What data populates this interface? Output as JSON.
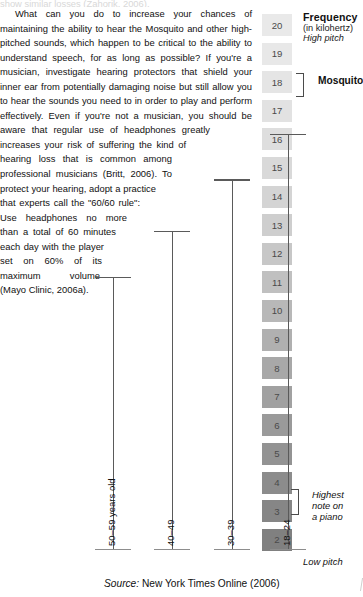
{
  "article": {
    "cut_line": "show similar losses (Zahorik, 2006).",
    "paragraph": "What can you do to increase your chances of maintaining the ability to hear the Mosquito and other high-pitched sounds, which happen to be critical to the ability to understand speech, for as long as possible? If you're a musician, investigate hearing protectors that shield your inner ear from potentially damaging noise but still allow you to hear the sounds you need to in order to play and perform effectively. Even if you're not a musician, you should be aware that regular use of headphones greatly increases your risk of suffering the kind of hearing loss that is common among professional musicians (Britt, 2006). To protect your hearing, adopt a practice that experts call the \"60/60 rule\": Use headphones no more than a total of 60 minutes each day with the player set on 60% of its maximum volume (Mayo Clinic, 2006a)."
  },
  "figure": {
    "legend": {
      "title": "Frequency",
      "unit": "(in kilohertz)",
      "high_pitch": "High pitch",
      "low_pitch": "Low pitch"
    },
    "annotations": [
      {
        "name": "mosquito",
        "label": "Mosquito",
        "at_value": 17
      },
      {
        "name": "piano",
        "label": "Highest\nnote on\na piano",
        "line1": "Highest",
        "line2": "note on",
        "line3": "a piano",
        "at_value": 4
      }
    ],
    "scale": {
      "max": 20,
      "min": 2,
      "values": [
        20,
        19,
        18,
        17,
        16,
        15,
        14,
        13,
        12,
        11,
        10,
        9,
        8,
        7,
        6,
        5,
        4,
        3,
        2
      ],
      "colors": [
        "#e9e9e9",
        "#e8e8e8",
        "#e5e5e5",
        "#e2e2e2",
        "#dedede",
        "#d9d9d9",
        "#d4d4d4",
        "#cecece",
        "#c7c7c7",
        "#c0c0c0",
        "#b8b8b8",
        "#b0b0b0",
        "#a8a8a8",
        "#a1a1a1",
        "#9a9a9a",
        "#939393",
        "#8c8c8c",
        "#868686",
        "#808080"
      ]
    },
    "source": {
      "label": "Source:",
      "text": "New York Times Online (2006)"
    }
  },
  "chart_data": {
    "type": "bar",
    "xlabel": "",
    "ylabel": "Frequency (in kilohertz)",
    "categories": [
      "50–59 years old",
      "40–49",
      "30–39",
      "18–24"
    ],
    "values": [
      11.2,
      12.8,
      14.6,
      16.2
    ],
    "ylim": [
      2,
      20
    ],
    "ytick_labels": [
      20,
      19,
      18,
      17,
      16,
      15,
      14,
      13,
      12,
      11,
      10,
      9,
      8,
      7,
      6,
      5,
      4,
      3,
      2
    ],
    "grid": false,
    "legend": "none",
    "annotations": [
      "High pitch",
      "Low pitch",
      "Mosquito",
      "Highest note on a piano"
    ],
    "source": "Source: New York Times Online (2006)"
  }
}
